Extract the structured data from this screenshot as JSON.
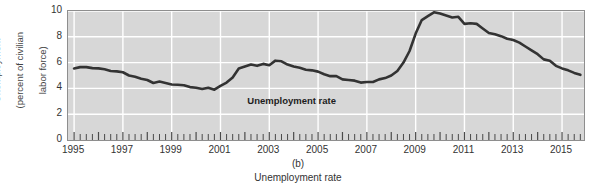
{
  "figure": {
    "panel_letter": "(b)",
    "caption": "Unemployment rate",
    "background_color": "#ffffff",
    "plot_background_color": "#d7d7d7",
    "gridline_color": "#ffffff",
    "line_color": "#333333",
    "frame_color": "#8e8e8e"
  },
  "axes": {
    "ylabel_line1": "Unemployment",
    "ylabel_line2": "(percent of civilian",
    "ylabel_line3": "labor force)",
    "y_ticks": [
      "10",
      "8",
      "6",
      "4",
      "2",
      "0"
    ],
    "x_ticks": [
      "1995",
      "1997",
      "1999",
      "2001",
      "2003",
      "2005",
      "2007",
      "2009",
      "2011",
      "2013",
      "2015"
    ]
  },
  "annotations": [
    {
      "text": "Unemployment rate",
      "x_year": 2002.1,
      "y_value": 3.05
    }
  ],
  "chart_data": {
    "type": "line",
    "title": "Unemployment rate",
    "subtitle": "(b)",
    "xlabel": "",
    "ylabel": "Unemployment (percent of civilian labor force)",
    "xlim": [
      1994.75,
      2015.9
    ],
    "ylim": [
      0,
      10
    ],
    "grid": true,
    "grid_x_interval": 2,
    "grid_y_interval": 2,
    "legend": "none",
    "x_minor_ticks": "quarterly",
    "units": "percent of civilian labor force",
    "series": [
      {
        "name": "Unemployment rate",
        "x": [
          1995.0,
          1995.25,
          1995.5,
          1995.75,
          1996.0,
          1996.25,
          1996.5,
          1996.75,
          1997.0,
          1997.25,
          1997.5,
          1997.75,
          1998.0,
          1998.25,
          1998.5,
          1998.75,
          1999.0,
          1999.25,
          1999.5,
          1999.75,
          2000.0,
          2000.25,
          2000.5,
          2000.75,
          2001.0,
          2001.25,
          2001.5,
          2001.75,
          2002.0,
          2002.25,
          2002.5,
          2002.75,
          2003.0,
          2003.25,
          2003.5,
          2003.75,
          2004.0,
          2004.25,
          2004.5,
          2004.75,
          2005.0,
          2005.25,
          2005.5,
          2005.75,
          2006.0,
          2006.25,
          2006.5,
          2006.75,
          2007.0,
          2007.25,
          2007.5,
          2007.75,
          2008.0,
          2008.25,
          2008.5,
          2008.75,
          2009.0,
          2009.25,
          2009.5,
          2009.75,
          2010.0,
          2010.25,
          2010.5,
          2010.75,
          2011.0,
          2011.25,
          2011.5,
          2011.75,
          2012.0,
          2012.25,
          2012.5,
          2012.75,
          2013.0,
          2013.25,
          2013.5,
          2013.75,
          2014.0,
          2014.25,
          2014.5,
          2014.75,
          2015.0,
          2015.25,
          2015.5,
          2015.75
        ],
        "values": [
          5.55,
          5.65,
          5.65,
          5.57,
          5.55,
          5.48,
          5.35,
          5.32,
          5.25,
          5.0,
          4.9,
          4.75,
          4.65,
          4.42,
          4.53,
          4.42,
          4.3,
          4.28,
          4.25,
          4.1,
          4.05,
          3.95,
          4.05,
          3.9,
          4.2,
          4.45,
          4.85,
          5.55,
          5.7,
          5.85,
          5.75,
          5.9,
          5.8,
          6.15,
          6.1,
          5.85,
          5.7,
          5.6,
          5.45,
          5.4,
          5.3,
          5.1,
          4.95,
          4.95,
          4.7,
          4.65,
          4.6,
          4.45,
          4.5,
          4.5,
          4.7,
          4.8,
          5.0,
          5.35,
          6.0,
          6.9,
          8.25,
          9.3,
          9.6,
          9.9,
          9.8,
          9.65,
          9.5,
          9.55,
          9.0,
          9.05,
          9.0,
          8.65,
          8.3,
          8.2,
          8.05,
          7.85,
          7.75,
          7.55,
          7.25,
          6.95,
          6.65,
          6.25,
          6.15,
          5.75,
          5.55,
          5.4,
          5.2,
          5.05
        ]
      }
    ]
  }
}
